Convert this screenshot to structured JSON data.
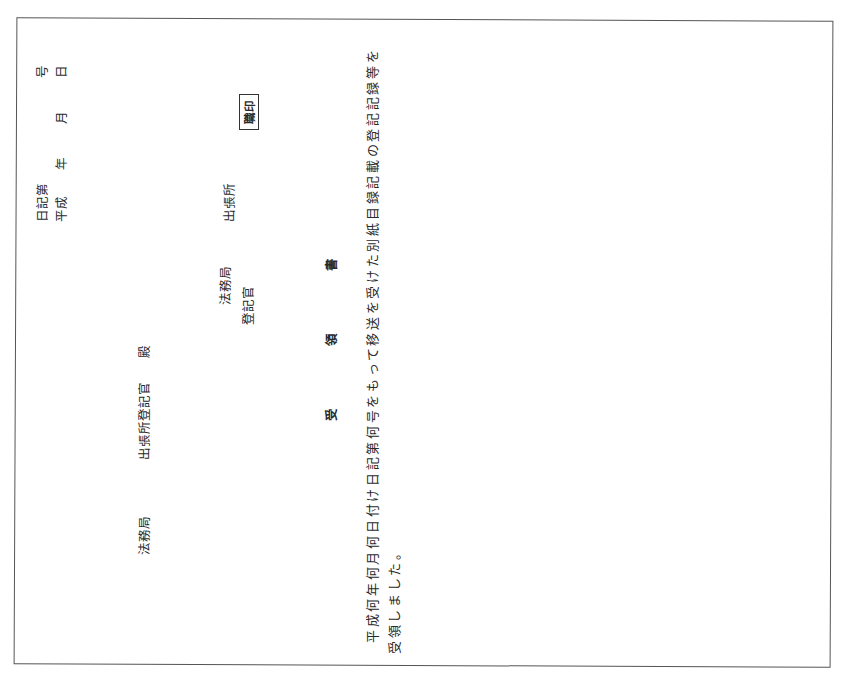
{
  "document": {
    "header": {
      "register_number": {
        "prefix": "日記第",
        "suffix": "号"
      },
      "date": {
        "era": "平成",
        "year_unit": "年",
        "month_unit": "月",
        "day_unit": "日"
      }
    },
    "addressee": {
      "bureau": "法務局",
      "office_officer": "出張所登記官",
      "honorific": "殿"
    },
    "sender": {
      "bureau": "法務局",
      "branch": "出張所",
      "officer": "登記官",
      "seal_label": "職印"
    },
    "title": {
      "char1": "受",
      "char2": "領",
      "char3": "書"
    },
    "body": {
      "line1": "平成何年何月何日付け日記第何号をもって移送を受けた別紙目録記載の登記記録等を",
      "line2": "受領しました。"
    }
  }
}
